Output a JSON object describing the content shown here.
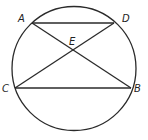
{
  "diagram": {
    "circle": {
      "cx": 74,
      "cy": 68.5,
      "r": 62
    },
    "points": {
      "A": {
        "x": 32,
        "y": 23
      },
      "D": {
        "x": 114,
        "y": 23
      },
      "C": {
        "x": 15,
        "y": 88
      },
      "B": {
        "x": 131,
        "y": 88
      },
      "E": {
        "x": 73,
        "y": 50
      }
    },
    "segments": [
      {
        "from": "A",
        "to": "D"
      },
      {
        "from": "C",
        "to": "B"
      },
      {
        "from": "A",
        "to": "B"
      },
      {
        "from": "C",
        "to": "D"
      }
    ],
    "labels": {
      "A": "A",
      "D": "D",
      "E": "E",
      "C": "C",
      "B": "B"
    },
    "colors": {
      "line": "#2a2a2a",
      "text": "#222222",
      "background": "#ffffff"
    }
  }
}
